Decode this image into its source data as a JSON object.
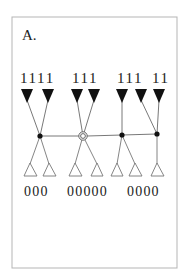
{
  "panel": {
    "label": "A.",
    "frame": {
      "x": 12,
      "y": 17,
      "width": 165,
      "height": 251,
      "stroke": "#b5b5b5"
    }
  },
  "colors": {
    "ink": "#111111",
    "line": "#555555",
    "open_triangle_stroke": "#777777"
  },
  "top_labels": {
    "text_groups": [
      "1111",
      "111",
      "111",
      "11"
    ],
    "full_text": "1111 111  111 11"
  },
  "bottom_labels": {
    "text_groups": [
      "000",
      "00000",
      "0000"
    ],
    "full_text": "000 00000 0000"
  },
  "nodes": [
    {
      "id": "n1",
      "type": "filled-dot",
      "x": 40,
      "y": 136
    },
    {
      "id": "n2",
      "type": "double-circle",
      "x": 83,
      "y": 136
    },
    {
      "id": "n3",
      "type": "filled-dot",
      "x": 122,
      "y": 135
    },
    {
      "id": "n4",
      "type": "filled-dot",
      "x": 157,
      "y": 134
    }
  ],
  "black_triangles": [
    27,
    48,
    77,
    94,
    122,
    141,
    159
  ],
  "open_triangles": [
    30,
    49,
    75,
    97,
    117,
    135,
    157
  ],
  "edges_up": [
    {
      "from": "n1",
      "to_triangle_x": 27
    },
    {
      "from": "n1",
      "to_triangle_x": 48
    },
    {
      "from": "n2",
      "to_triangle_x": 77
    },
    {
      "from": "n2",
      "to_triangle_x": 94
    },
    {
      "from": "n3",
      "to_triangle_x": 122
    },
    {
      "from": "n4",
      "to_triangle_x": 141
    },
    {
      "from": "n4",
      "to_triangle_x": 159
    }
  ],
  "edges_down": [
    {
      "from": "n1",
      "to_triangle_x": 30
    },
    {
      "from": "n1",
      "to_triangle_x": 49
    },
    {
      "from": "n2",
      "to_triangle_x": 75
    },
    {
      "from": "n2",
      "to_triangle_x": 97
    },
    {
      "from": "n3",
      "to_triangle_x": 117
    },
    {
      "from": "n3",
      "to_triangle_x": 135
    },
    {
      "from": "n4",
      "to_triangle_x": 157
    }
  ]
}
